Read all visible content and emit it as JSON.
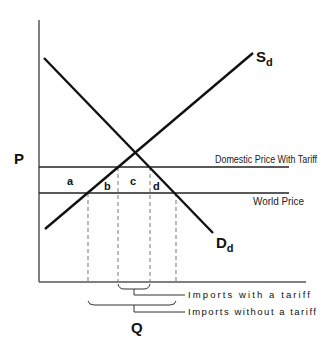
{
  "diagram": {
    "type": "tariff-supply-demand",
    "axes": {
      "y_label": "P",
      "x_label": "Q"
    },
    "curves": {
      "supply": {
        "label": "S",
        "subscript": "d"
      },
      "demand": {
        "label": "D",
        "subscript": "d"
      }
    },
    "price_lines": {
      "tariff": "Domestic Price With Tariff",
      "world": "World Price"
    },
    "areas": [
      "a",
      "b",
      "c",
      "d"
    ],
    "brackets": {
      "with_tariff": "Imports  with a tariff",
      "without_tariff": "Imports without a tariff"
    },
    "colors": {
      "line": "#111111",
      "axis": "#555555",
      "dashed": "#777777"
    }
  }
}
